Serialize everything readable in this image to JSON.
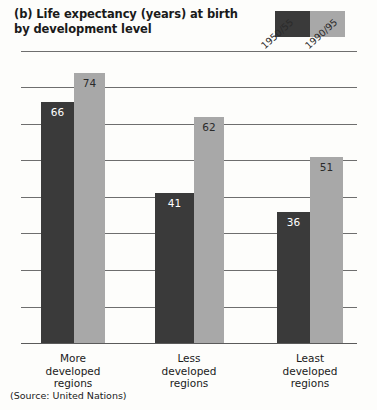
{
  "figure": {
    "title_lines": [
      "(b) Life expectancy (years) at birth",
      "by development level"
    ],
    "source": "(Source: United Nations)"
  },
  "legend": {
    "items": [
      {
        "label": "1950/55",
        "color": "#3a3a3a",
        "name": "legend-swatch-1950-55"
      },
      {
        "label": "1990/95",
        "color": "#a8a8a8",
        "name": "legend-swatch-1990-95"
      }
    ]
  },
  "colors": {
    "series_1950_55": "#3a3a3a",
    "series_1990_95": "#a8a8a8",
    "gridline": "#6e6e6e",
    "axis": "#5a5a5a",
    "background": "#fdfdfb"
  },
  "chart_data": {
    "type": "bar",
    "title": "(b) Life expectancy (years) at birth by development level",
    "xlabel": "",
    "ylabel": "",
    "categories": [
      "More developed regions",
      "Less developed regions",
      "Least developed regions"
    ],
    "category_lines": [
      [
        "More",
        "developed",
        "regions"
      ],
      [
        "Less",
        "developed",
        "regions"
      ],
      [
        "Least",
        "developed",
        "regions"
      ]
    ],
    "series": [
      {
        "name": "1950/55",
        "color": "#3a3a3a",
        "values": [
          66,
          41,
          36
        ]
      },
      {
        "name": "1990/95",
        "color": "#a8a8a8",
        "values": [
          74,
          62,
          51
        ]
      }
    ],
    "ylim": [
      0,
      80
    ],
    "y_gridlines": [
      10,
      20,
      30,
      40,
      50,
      60,
      70,
      80
    ],
    "grid": true,
    "y_tick_labels_shown": false,
    "legend_position": "top-right",
    "annotation": "(Source: United Nations)"
  }
}
